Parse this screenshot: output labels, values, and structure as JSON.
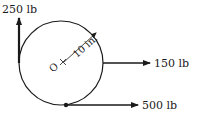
{
  "diagram": {
    "type": "free-body diagram",
    "circle": {
      "center_label": "O",
      "radius_label": "10 in."
    },
    "forces": [
      {
        "id": "f250",
        "label": "250 lb",
        "direction": "up",
        "applied_at": "left of circle"
      },
      {
        "id": "f150",
        "label": "150 lb",
        "direction": "right",
        "applied_at": "right of circle"
      },
      {
        "id": "f500",
        "label": "500 lb",
        "direction": "right",
        "applied_at": "bottom of circle"
      }
    ],
    "colors": {
      "line": "#1a1a1a",
      "background": "#ffffff"
    }
  }
}
